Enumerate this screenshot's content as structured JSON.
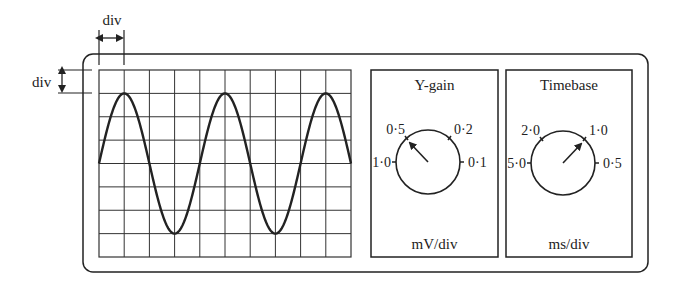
{
  "colors": {
    "stroke": "#222222",
    "grid": "#333333",
    "background": "#ffffff"
  },
  "annotations": {
    "horizontal_div_label": "div",
    "vertical_div_label": "div"
  },
  "screen": {
    "grid_columns": 10,
    "grid_rows": 8,
    "waveform": {
      "type": "sine",
      "amplitude_div": 3,
      "period_div": 4,
      "start_phase": "zero-crossing rising",
      "cycles_shown": 2.5
    }
  },
  "ygain": {
    "title": "Y-gain",
    "unit": "mV/div",
    "settings": [
      "1·0",
      "0·5",
      "0·2",
      "0·1"
    ],
    "selected": "0·5"
  },
  "timebase": {
    "title": "Timebase",
    "unit": "ms/div",
    "settings": [
      "5·0",
      "2·0",
      "1·0",
      "0·5"
    ],
    "selected": "1·0"
  }
}
